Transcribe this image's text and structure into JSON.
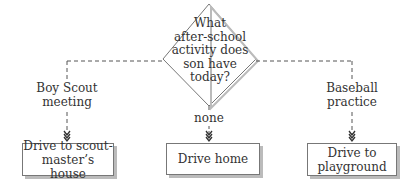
{
  "diagram": {
    "type": "flowchart",
    "decision": {
      "text": "What after-school activity does son have today?"
    },
    "branches": [
      {
        "label": "Boy Scout meeting",
        "target": "Drive to scout-master’s house"
      },
      {
        "label": "none",
        "target": "Drive home"
      },
      {
        "label": "Baseball practice",
        "target": "Drive to playground"
      }
    ]
  },
  "decision_lines": [
    "What",
    "after-school",
    "activity does",
    "son have",
    "today?"
  ],
  "labels": {
    "left": "Boy Scout\nmeeting",
    "middle": "none",
    "right": "Baseball\npractice"
  },
  "boxes": {
    "left": "Drive to scout-\nmaster’s house",
    "middle": "Drive home",
    "right": "Drive to\nplayground"
  },
  "colors": {
    "line": "#555555",
    "shadow": "#bbbbbb",
    "text": "#333333"
  }
}
